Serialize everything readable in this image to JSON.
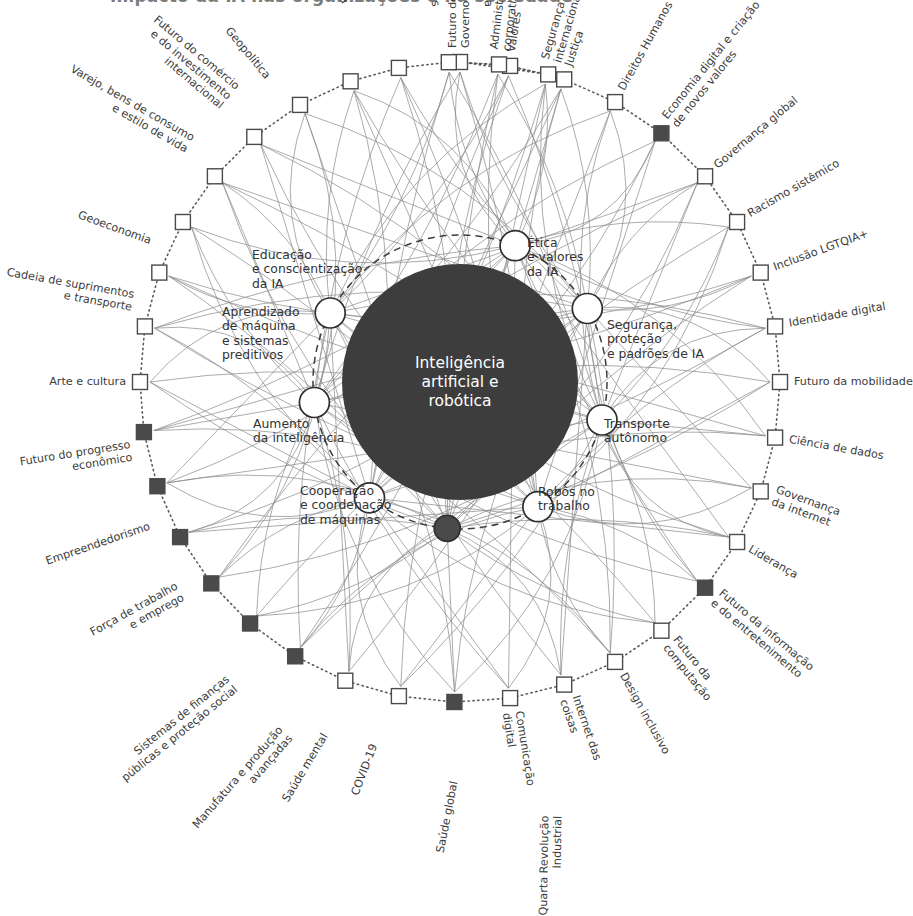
{
  "header": {
    "title": "Impacto da IA nas organizações e na sociedade",
    "side_note": "Parceiros: Inteligência artificial aplicada a negócios"
  },
  "hub": {
    "label": "Inteligência\nartificial e\nrobótica",
    "color": "#3d3d3d",
    "text_color": "#ffffff",
    "cx": 460,
    "cy": 382,
    "r": 118
  },
  "legend": {
    "node_outline_color": "#4a4a4a",
    "node_fill_light": "#ffffff",
    "node_fill_dark": "#4a4a4a",
    "link_color": "#8c8c8c",
    "ring_color": "#5a5a5a"
  },
  "inner_nodes": [
    {
      "id": "edu-ia",
      "label": "Educação\ne conscientização\nda IA",
      "angle": -68,
      "filled": false,
      "lx": 252,
      "ly": 248,
      "align": "left"
    },
    {
      "id": "etica",
      "label": "Ética\ne valores\nda IA",
      "angle": -30,
      "filled": false,
      "lx": 527,
      "ly": 236,
      "align": "left"
    },
    {
      "id": "seguranca",
      "label": "Segurança,\nproteção\ne padrões de IA",
      "angle": 15,
      "filled": false,
      "lx": 607,
      "ly": 318,
      "align": "left"
    },
    {
      "id": "transporte",
      "label": "Transporte\nautônomo",
      "angle": 58,
      "filled": false,
      "lx": 604,
      "ly": 417,
      "align": "left"
    },
    {
      "id": "robos",
      "label": "Robôs no\ntrabalho",
      "angle": 95,
      "filled": true,
      "lx": 538,
      "ly": 485,
      "align": "left"
    },
    {
      "id": "cooperacao",
      "label": "Cooperação\ne coordenação\nde máquinas",
      "angle": 128,
      "filled": false,
      "lx": 300,
      "ly": 484,
      "align": "left"
    },
    {
      "id": "aumento",
      "label": "Aumento\nda inteligência",
      "angle": 172,
      "filled": false,
      "lx": 253,
      "ly": 417,
      "align": "left"
    },
    {
      "id": "aprendizado",
      "label": "Aprendizado\nde máquina\ne sistemas\npreditivos",
      "angle": 208,
      "filled": false,
      "lx": 222,
      "ly": 305,
      "align": "left"
    }
  ],
  "outer_nodes": [
    {
      "label": "Futuro do\nGoverno",
      "angle": -90,
      "filled": false
    },
    {
      "label": "Valores",
      "angle": -81,
      "filled": false
    },
    {
      "label": "Justiça",
      "angle": -71,
      "filled": false
    },
    {
      "label": "Direitos Humanos",
      "angle": -61,
      "filled": false
    },
    {
      "label": "Economia digital e criação\nde novos valores",
      "angle": -51,
      "filled": true
    },
    {
      "label": "Governança global",
      "angle": -40,
      "filled": false
    },
    {
      "label": "Racismo sistêmico",
      "angle": -30,
      "filled": false
    },
    {
      "label": "Inclusão LGTQIA+",
      "angle": -20,
      "filled": false
    },
    {
      "label": "Identidade digital",
      "angle": -10,
      "filled": false
    },
    {
      "label": "Futuro da mobilidade",
      "angle": 0,
      "filled": false
    },
    {
      "label": "Ciência de dados",
      "angle": 10,
      "filled": false
    },
    {
      "label": "Governança\nda internet",
      "angle": 20,
      "filled": false
    },
    {
      "label": "Liderança",
      "angle": 30,
      "filled": false
    },
    {
      "label": "Futuro da informação\ne do entretenimento",
      "angle": 40,
      "filled": true
    },
    {
      "label": "Futuro da\ncomputação",
      "angle": 51,
      "filled": false
    },
    {
      "label": "Design inclusivo",
      "angle": 61,
      "filled": false
    },
    {
      "label": "Internet das\ncoisas",
      "angle": 71,
      "filled": false
    },
    {
      "label": "Comunicação\ndigital",
      "angle": 81,
      "filled": false
    },
    {
      "label": "Quarta Revolução\nIndustrial",
      "angle": 91,
      "filled": true
    },
    {
      "label": "Saúde global",
      "angle": 101,
      "filled": false
    },
    {
      "label": "COVID-19",
      "angle": 111,
      "filled": false
    },
    {
      "label": "Saúde mental",
      "angle": 121,
      "filled": true
    },
    {
      "label": "Manufatura e produção\navançadas",
      "angle": 131,
      "filled": true
    },
    {
      "label": "Sistemas de finanças\npúblicas e proteção social",
      "angle": 141,
      "filled": true
    },
    {
      "label": "Força de trabalho\ne emprego",
      "angle": 151,
      "filled": true
    },
    {
      "label": "Empreendedorismo",
      "angle": 161,
      "filled": true
    },
    {
      "label": "Futuro do progresso\neconômico",
      "angle": 171,
      "filled": true
    },
    {
      "label": "Arte e cultura",
      "angle": 180,
      "filled": false
    },
    {
      "label": "Cadeia de suprimentos\ne transporte",
      "angle": 190,
      "filled": false
    },
    {
      "label": "Geoeconomia",
      "angle": 200,
      "filled": false
    },
    {
      "label": "Varejo, bens de consumo\ne estilo de vida",
      "angle": 210,
      "filled": false
    },
    {
      "label": "Futuro do comércio\ne do investimento\ninternacional",
      "angle": 220,
      "filled": false
    },
    {
      "label": "Geopolítica",
      "angle": 230,
      "filled": false
    },
    {
      "label": "Participação cívica",
      "angle": 240,
      "filled": false
    },
    {
      "label": "Educação\ne capacitações",
      "angle": 250,
      "filled": false
    },
    {
      "label": "Oceanos",
      "angle": 259,
      "filled": false
    },
    {
      "label": "Ciência",
      "angle": 268,
      "filled": false
    },
    {
      "label": "Administração\ncorporativa",
      "angle": 277,
      "filled": false
    },
    {
      "label": "Segurança\ninternacional",
      "angle": 286,
      "filled": false
    }
  ],
  "geometry": {
    "outer_radius": 320,
    "inner_radius": 147,
    "outer_node_size": 15,
    "inner_node_r": 15
  }
}
